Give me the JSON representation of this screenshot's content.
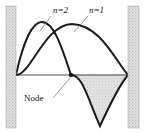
{
  "figure": {
    "background_color": "#ffffff",
    "width": 148,
    "height": 134
  },
  "walls": {
    "fill_color": "#d9d9d9",
    "edge_color": "#b0b0b0",
    "left": {
      "x": 6,
      "y": 6,
      "width": 10,
      "height": 122
    },
    "right": {
      "x": 128,
      "y": 6,
      "width": 11,
      "height": 122
    }
  },
  "axis": {
    "color": "#555555",
    "x_start": 16,
    "x_end": 128,
    "y": 75
  },
  "shading": {
    "fill_color": "#dcdcdc",
    "edge_color": "#999999",
    "description": "region between axis and n=2 curve right of node"
  },
  "curves": [
    {
      "name": "n=1",
      "label": "n=1",
      "color": "#1a1a1a",
      "stroke_width": 2.0,
      "nodes": 0,
      "peak": {
        "x": 72,
        "y": 24
      },
      "endpoints": [
        {
          "x": 16,
          "y": 75
        },
        {
          "x": 128,
          "y": 75
        }
      ]
    },
    {
      "name": "n=2",
      "label": "n=2",
      "color": "#1a1a1a",
      "stroke_width": 2.0,
      "nodes": 1,
      "peak": {
        "x": 42,
        "y": 22
      },
      "trough": {
        "x": 100,
        "y": 127
      },
      "endpoints": [
        {
          "x": 16,
          "y": 75
        },
        {
          "x": 128,
          "y": 75
        }
      ]
    }
  ],
  "labels": {
    "n2": {
      "text": "n=2",
      "x": 53,
      "y": 13,
      "leader": {
        "x1": 51,
        "y1": 16,
        "x2": 40,
        "y2": 31
      }
    },
    "n1": {
      "text": "n=1",
      "x": 89,
      "y": 13,
      "leader": {
        "x1": 88,
        "y1": 16,
        "x2": 74,
        "y2": 32
      }
    },
    "node": {
      "text": "Node",
      "x": 24,
      "y": 101,
      "leader": {
        "x1": 53,
        "y1": 98,
        "x2": 70,
        "y2": 78
      }
    }
  },
  "node_marker": {
    "x": 71,
    "y": 75,
    "radius": 2.2,
    "color": "#1a1a1a"
  }
}
